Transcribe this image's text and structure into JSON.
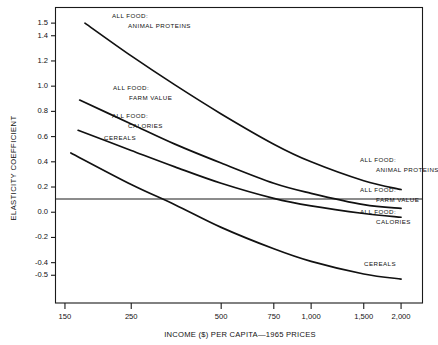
{
  "chart_data": {
    "type": "line",
    "title": "",
    "xlabel": "INCOME ($) PER CAPITA—1965 PRICES",
    "ylabel": "ELASTICITY COEFFICIENT",
    "xscale": "log",
    "xlim": [
      140,
      2350
    ],
    "ylim": [
      -0.72,
      1.62
    ],
    "grid": false,
    "legend": "inline-right-and-left-annotations",
    "x_ticks": [
      {
        "value": 150,
        "label": "150"
      },
      {
        "value": 250,
        "label": "250"
      },
      {
        "value": 500,
        "label": "500"
      },
      {
        "value": 750,
        "label": "750"
      },
      {
        "value": 1000,
        "label": "1,000"
      },
      {
        "value": 1500,
        "label": "1,500"
      },
      {
        "value": 2000,
        "label": "2,000"
      }
    ],
    "y_ticks": [
      {
        "value": 1.5,
        "label": "1.5"
      },
      {
        "value": 1.4,
        "label": "1.4"
      },
      {
        "value": 1.2,
        "label": "1.2"
      },
      {
        "value": 1.0,
        "label": "1.0"
      },
      {
        "value": 0.8,
        "label": "0.8"
      },
      {
        "value": 0.6,
        "label": "0.6"
      },
      {
        "value": 0.4,
        "label": "0.4"
      },
      {
        "value": 0.2,
        "label": "0.2"
      },
      {
        "value": 0.0,
        "label": "0.0"
      },
      {
        "value": -0.2,
        "label": "-0.2"
      },
      {
        "value": -0.4,
        "label": "-0.4"
      },
      {
        "value": -0.5,
        "label": "-0.5"
      }
    ],
    "zero_reference_line": 0.0,
    "series": [
      {
        "name": "ALL FOOD: ANIMAL PROTEINS",
        "color": "#111111",
        "points": [
          {
            "x": 175,
            "y": 1.5
          },
          {
            "x": 250,
            "y": 1.24
          },
          {
            "x": 350,
            "y": 1.01
          },
          {
            "x": 500,
            "y": 0.78
          },
          {
            "x": 750,
            "y": 0.54
          },
          {
            "x": 1000,
            "y": 0.4
          },
          {
            "x": 1500,
            "y": 0.25
          },
          {
            "x": 2000,
            "y": 0.18
          }
        ]
      },
      {
        "name": "ALL FOOD: FARM VALUE",
        "color": "#111111",
        "points": [
          {
            "x": 168,
            "y": 0.89
          },
          {
            "x": 250,
            "y": 0.7
          },
          {
            "x": 350,
            "y": 0.54
          },
          {
            "x": 500,
            "y": 0.39
          },
          {
            "x": 750,
            "y": 0.23
          },
          {
            "x": 1000,
            "y": 0.15
          },
          {
            "x": 1500,
            "y": 0.06
          },
          {
            "x": 2000,
            "y": 0.03
          }
        ]
      },
      {
        "name": "ALL FOOD: CALORIES",
        "color": "#111111",
        "points": [
          {
            "x": 166,
            "y": 0.65
          },
          {
            "x": 250,
            "y": 0.49
          },
          {
            "x": 350,
            "y": 0.36
          },
          {
            "x": 500,
            "y": 0.23
          },
          {
            "x": 750,
            "y": 0.11
          },
          {
            "x": 1000,
            "y": 0.05
          },
          {
            "x": 1500,
            "y": -0.01
          },
          {
            "x": 2000,
            "y": -0.04
          }
        ]
      },
      {
        "name": "CEREALS",
        "color": "#111111",
        "points": [
          {
            "x": 157,
            "y": 0.47
          },
          {
            "x": 250,
            "y": 0.22
          },
          {
            "x": 350,
            "y": 0.06
          },
          {
            "x": 500,
            "y": -0.12
          },
          {
            "x": 750,
            "y": -0.29
          },
          {
            "x": 1000,
            "y": -0.39
          },
          {
            "x": 1500,
            "y": -0.49
          },
          {
            "x": 2000,
            "y": -0.53
          }
        ]
      }
    ],
    "annotations_left": [
      {
        "id": "ann-left-animal-proteins",
        "line1": "ALL FOOD:",
        "line2": "ANIMAL PROTEINS"
      },
      {
        "id": "ann-left-farm-value",
        "line1": "ALL FOOD:",
        "line2": "FARM VALUE"
      },
      {
        "id": "ann-left-calories",
        "line1": "ALL FOOD:",
        "line2": "CALORIES"
      },
      {
        "id": "ann-left-cereals",
        "line1": "CEREALS",
        "line2": ""
      }
    ],
    "annotations_right": [
      {
        "id": "ann-right-animal-proteins",
        "line1": "ALL FOOD:",
        "line2": "ANIMAL PROTEINS"
      },
      {
        "id": "ann-right-farm-value",
        "line1": "ALL FOOD:",
        "line2": "FARM VALUE"
      },
      {
        "id": "ann-right-calories",
        "line1": "ALL FOOD:",
        "line2": "CALORIES"
      },
      {
        "id": "ann-right-cereals",
        "line1": "CEREALS",
        "line2": ""
      }
    ]
  }
}
